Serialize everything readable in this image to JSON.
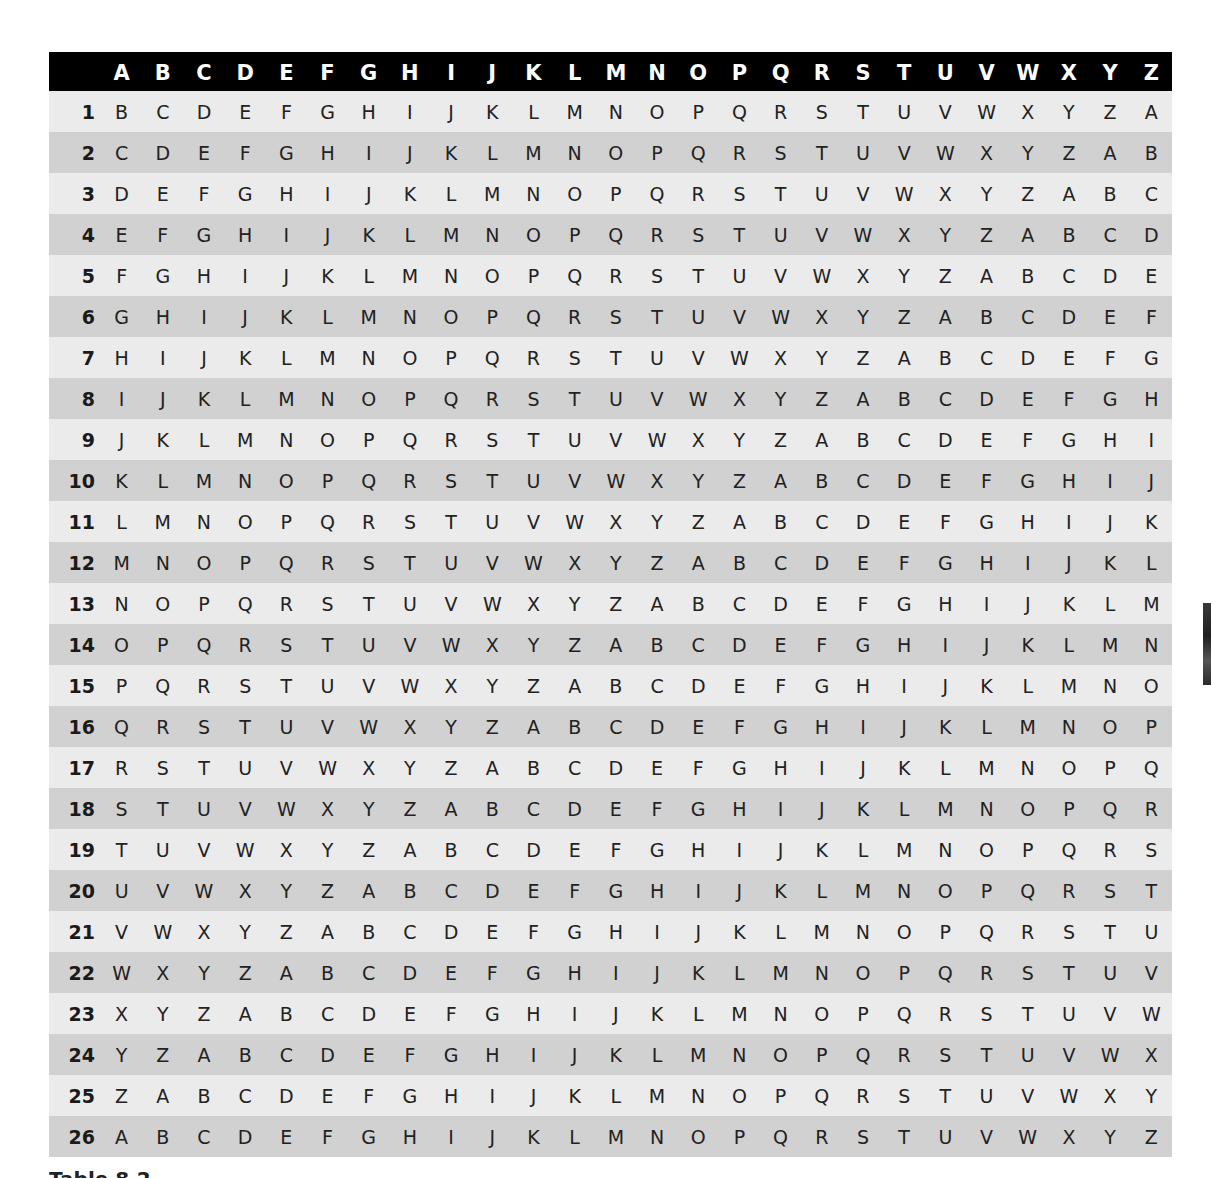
{
  "table": {
    "header": {
      "corner": "",
      "columns": [
        "A",
        "B",
        "C",
        "D",
        "E",
        "F",
        "G",
        "H",
        "I",
        "J",
        "K",
        "L",
        "M",
        "N",
        "O",
        "P",
        "Q",
        "R",
        "S",
        "T",
        "U",
        "V",
        "W",
        "X",
        "Y",
        "Z"
      ]
    },
    "rows": [
      {
        "label": "1",
        "cells": [
          "B",
          "C",
          "D",
          "E",
          "F",
          "G",
          "H",
          "I",
          "J",
          "K",
          "L",
          "M",
          "N",
          "O",
          "P",
          "Q",
          "R",
          "S",
          "T",
          "U",
          "V",
          "W",
          "X",
          "Y",
          "Z",
          "A"
        ]
      },
      {
        "label": "2",
        "cells": [
          "C",
          "D",
          "E",
          "F",
          "G",
          "H",
          "I",
          "J",
          "K",
          "L",
          "M",
          "N",
          "O",
          "P",
          "Q",
          "R",
          "S",
          "T",
          "U",
          "V",
          "W",
          "X",
          "Y",
          "Z",
          "A",
          "B"
        ]
      },
      {
        "label": "3",
        "cells": [
          "D",
          "E",
          "F",
          "G",
          "H",
          "I",
          "J",
          "K",
          "L",
          "M",
          "N",
          "O",
          "P",
          "Q",
          "R",
          "S",
          "T",
          "U",
          "V",
          "W",
          "X",
          "Y",
          "Z",
          "A",
          "B",
          "C"
        ]
      },
      {
        "label": "4",
        "cells": [
          "E",
          "F",
          "G",
          "H",
          "I",
          "J",
          "K",
          "L",
          "M",
          "N",
          "O",
          "P",
          "Q",
          "R",
          "S",
          "T",
          "U",
          "V",
          "W",
          "X",
          "Y",
          "Z",
          "A",
          "B",
          "C",
          "D"
        ]
      },
      {
        "label": "5",
        "cells": [
          "F",
          "G",
          "H",
          "I",
          "J",
          "K",
          "L",
          "M",
          "N",
          "O",
          "P",
          "Q",
          "R",
          "S",
          "T",
          "U",
          "V",
          "W",
          "X",
          "Y",
          "Z",
          "A",
          "B",
          "C",
          "D",
          "E"
        ]
      },
      {
        "label": "6",
        "cells": [
          "G",
          "H",
          "I",
          "J",
          "K",
          "L",
          "M",
          "N",
          "O",
          "P",
          "Q",
          "R",
          "S",
          "T",
          "U",
          "V",
          "W",
          "X",
          "Y",
          "Z",
          "A",
          "B",
          "C",
          "D",
          "E",
          "F"
        ]
      },
      {
        "label": "7",
        "cells": [
          "H",
          "I",
          "J",
          "K",
          "L",
          "M",
          "N",
          "O",
          "P",
          "Q",
          "R",
          "S",
          "T",
          "U",
          "V",
          "W",
          "X",
          "Y",
          "Z",
          "A",
          "B",
          "C",
          "D",
          "E",
          "F",
          "G"
        ]
      },
      {
        "label": "8",
        "cells": [
          "I",
          "J",
          "K",
          "L",
          "M",
          "N",
          "O",
          "P",
          "Q",
          "R",
          "S",
          "T",
          "U",
          "V",
          "W",
          "X",
          "Y",
          "Z",
          "A",
          "B",
          "C",
          "D",
          "E",
          "F",
          "G",
          "H"
        ]
      },
      {
        "label": "9",
        "cells": [
          "J",
          "K",
          "L",
          "M",
          "N",
          "O",
          "P",
          "Q",
          "R",
          "S",
          "T",
          "U",
          "V",
          "W",
          "X",
          "Y",
          "Z",
          "A",
          "B",
          "C",
          "D",
          "E",
          "F",
          "G",
          "H",
          "I"
        ]
      },
      {
        "label": "10",
        "cells": [
          "K",
          "L",
          "M",
          "N",
          "O",
          "P",
          "Q",
          "R",
          "S",
          "T",
          "U",
          "V",
          "W",
          "X",
          "Y",
          "Z",
          "A",
          "B",
          "C",
          "D",
          "E",
          "F",
          "G",
          "H",
          "I",
          "J"
        ]
      },
      {
        "label": "11",
        "cells": [
          "L",
          "M",
          "N",
          "O",
          "P",
          "Q",
          "R",
          "S",
          "T",
          "U",
          "V",
          "W",
          "X",
          "Y",
          "Z",
          "A",
          "B",
          "C",
          "D",
          "E",
          "F",
          "G",
          "H",
          "I",
          "J",
          "K"
        ]
      },
      {
        "label": "12",
        "cells": [
          "M",
          "N",
          "O",
          "P",
          "Q",
          "R",
          "S",
          "T",
          "U",
          "V",
          "W",
          "X",
          "Y",
          "Z",
          "A",
          "B",
          "C",
          "D",
          "E",
          "F",
          "G",
          "H",
          "I",
          "J",
          "K",
          "L"
        ]
      },
      {
        "label": "13",
        "cells": [
          "N",
          "O",
          "P",
          "Q",
          "R",
          "S",
          "T",
          "U",
          "V",
          "W",
          "X",
          "Y",
          "Z",
          "A",
          "B",
          "C",
          "D",
          "E",
          "F",
          "G",
          "H",
          "I",
          "J",
          "K",
          "L",
          "M"
        ]
      },
      {
        "label": "14",
        "cells": [
          "O",
          "P",
          "Q",
          "R",
          "S",
          "T",
          "U",
          "V",
          "W",
          "X",
          "Y",
          "Z",
          "A",
          "B",
          "C",
          "D",
          "E",
          "F",
          "G",
          "H",
          "I",
          "J",
          "K",
          "L",
          "M",
          "N"
        ]
      },
      {
        "label": "15",
        "cells": [
          "P",
          "Q",
          "R",
          "S",
          "T",
          "U",
          "V",
          "W",
          "X",
          "Y",
          "Z",
          "A",
          "B",
          "C",
          "D",
          "E",
          "F",
          "G",
          "H",
          "I",
          "J",
          "K",
          "L",
          "M",
          "N",
          "O"
        ]
      },
      {
        "label": "16",
        "cells": [
          "Q",
          "R",
          "S",
          "T",
          "U",
          "V",
          "W",
          "X",
          "Y",
          "Z",
          "A",
          "B",
          "C",
          "D",
          "E",
          "F",
          "G",
          "H",
          "I",
          "J",
          "K",
          "L",
          "M",
          "N",
          "O",
          "P"
        ]
      },
      {
        "label": "17",
        "cells": [
          "R",
          "S",
          "T",
          "U",
          "V",
          "W",
          "X",
          "Y",
          "Z",
          "A",
          "B",
          "C",
          "D",
          "E",
          "F",
          "G",
          "H",
          "I",
          "J",
          "K",
          "L",
          "M",
          "N",
          "O",
          "P",
          "Q"
        ]
      },
      {
        "label": "18",
        "cells": [
          "S",
          "T",
          "U",
          "V",
          "W",
          "X",
          "Y",
          "Z",
          "A",
          "B",
          "C",
          "D",
          "E",
          "F",
          "G",
          "H",
          "I",
          "J",
          "K",
          "L",
          "M",
          "N",
          "O",
          "P",
          "Q",
          "R"
        ]
      },
      {
        "label": "19",
        "cells": [
          "T",
          "U",
          "V",
          "W",
          "X",
          "Y",
          "Z",
          "A",
          "B",
          "C",
          "D",
          "E",
          "F",
          "G",
          "H",
          "I",
          "J",
          "K",
          "L",
          "M",
          "N",
          "O",
          "P",
          "Q",
          "R",
          "S"
        ]
      },
      {
        "label": "20",
        "cells": [
          "U",
          "V",
          "W",
          "X",
          "Y",
          "Z",
          "A",
          "B",
          "C",
          "D",
          "E",
          "F",
          "G",
          "H",
          "I",
          "J",
          "K",
          "L",
          "M",
          "N",
          "O",
          "P",
          "Q",
          "R",
          "S",
          "T"
        ]
      },
      {
        "label": "21",
        "cells": [
          "V",
          "W",
          "X",
          "Y",
          "Z",
          "A",
          "B",
          "C",
          "D",
          "E",
          "F",
          "G",
          "H",
          "I",
          "J",
          "K",
          "L",
          "M",
          "N",
          "O",
          "P",
          "Q",
          "R",
          "S",
          "T",
          "U"
        ]
      },
      {
        "label": "22",
        "cells": [
          "W",
          "X",
          "Y",
          "Z",
          "A",
          "B",
          "C",
          "D",
          "E",
          "F",
          "G",
          "H",
          "I",
          "J",
          "K",
          "L",
          "M",
          "N",
          "O",
          "P",
          "Q",
          "R",
          "S",
          "T",
          "U",
          "V"
        ]
      },
      {
        "label": "23",
        "cells": [
          "X",
          "Y",
          "Z",
          "A",
          "B",
          "C",
          "D",
          "E",
          "F",
          "G",
          "H",
          "I",
          "J",
          "K",
          "L",
          "M",
          "N",
          "O",
          "P",
          "Q",
          "R",
          "S",
          "T",
          "U",
          "V",
          "W"
        ]
      },
      {
        "label": "24",
        "cells": [
          "Y",
          "Z",
          "A",
          "B",
          "C",
          "D",
          "E",
          "F",
          "G",
          "H",
          "I",
          "J",
          "K",
          "L",
          "M",
          "N",
          "O",
          "P",
          "Q",
          "R",
          "S",
          "T",
          "U",
          "V",
          "W",
          "X"
        ]
      },
      {
        "label": "25",
        "cells": [
          "Z",
          "A",
          "B",
          "C",
          "D",
          "E",
          "F",
          "G",
          "H",
          "I",
          "J",
          "K",
          "L",
          "M",
          "N",
          "O",
          "P",
          "Q",
          "R",
          "S",
          "T",
          "U",
          "V",
          "W",
          "X",
          "Y"
        ]
      },
      {
        "label": "26",
        "cells": [
          "A",
          "B",
          "C",
          "D",
          "E",
          "F",
          "G",
          "H",
          "I",
          "J",
          "K",
          "L",
          "M",
          "N",
          "O",
          "P",
          "Q",
          "R",
          "S",
          "T",
          "U",
          "V",
          "W",
          "X",
          "Y",
          "Z"
        ]
      }
    ]
  },
  "caption": {
    "text": "Table 8.2"
  },
  "colors": {
    "header_bg": "#000000",
    "header_text": "#ffffff",
    "row_light": "#ebebeb",
    "row_dark": "#d1d1d1",
    "cell_text": "#222222"
  }
}
